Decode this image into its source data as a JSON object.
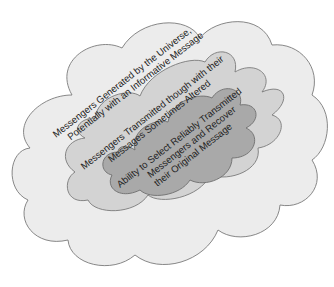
{
  "diagram": {
    "type": "nested-clouds",
    "layers": [
      {
        "id": "outer",
        "lines": [
          "Messengers Generated by the Universe,",
          "Potentially with an Informative Message"
        ],
        "fill": "#ececec",
        "stroke": "#7a7a7a"
      },
      {
        "id": "middle",
        "lines": [
          "Messengers Transmitted though with their",
          "Messages Sometimes Altered"
        ],
        "fill": "#d3d3d3",
        "stroke": "#7a7a7a"
      },
      {
        "id": "inner",
        "lines": [
          "Ability to Select Reliably Transmitted",
          "Messengers and Recover",
          "their Original Message"
        ],
        "fill": "#a9a9a9",
        "stroke": "#6e6e6e"
      }
    ]
  }
}
